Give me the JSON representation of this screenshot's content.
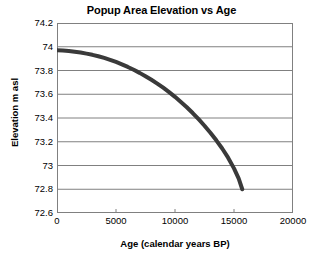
{
  "chart_data": {
    "type": "line",
    "title": "Popup Area Elevation vs Age",
    "xlabel": "Age (calendar years BP)",
    "ylabel": "Elevation m asl",
    "xlim": [
      0,
      20000
    ],
    "ylim": [
      72.6,
      74.2
    ],
    "xticks": [
      0,
      5000,
      10000,
      15000,
      20000
    ],
    "xtick_labels": [
      "0",
      "5000",
      "10000",
      "15000",
      "20000"
    ],
    "yticks": [
      72.6,
      72.8,
      73,
      73.2,
      73.4,
      73.6,
      73.8,
      74,
      74.2
    ],
    "ytick_labels": [
      "72.6",
      "72.8",
      "73",
      "73.2",
      "73.4",
      "73.6",
      "73.8",
      "74",
      "74.2"
    ],
    "grid": "horizontal",
    "legend": null,
    "series": [
      {
        "name": "Elevation",
        "color": "#3a3a3a",
        "line_width": 4,
        "x": [
          0,
          500,
          1000,
          1500,
          2000,
          2500,
          3000,
          3500,
          4000,
          4500,
          5000,
          5500,
          6000,
          6500,
          7000,
          7500,
          8000,
          8500,
          9000,
          9500,
          10000,
          10500,
          11000,
          11500,
          12000,
          12500,
          13000,
          13500,
          14000,
          14500,
          15000,
          15400,
          15700
        ],
        "y": [
          73.97,
          73.968,
          73.964,
          73.958,
          73.951,
          73.942,
          73.932,
          73.92,
          73.906,
          73.89,
          73.872,
          73.852,
          73.83,
          73.806,
          73.78,
          73.752,
          73.722,
          73.69,
          73.655,
          73.618,
          73.578,
          73.535,
          73.49,
          73.442,
          73.39,
          73.335,
          73.276,
          73.212,
          73.143,
          73.066,
          72.976,
          72.89,
          72.8
        ]
      }
    ]
  }
}
